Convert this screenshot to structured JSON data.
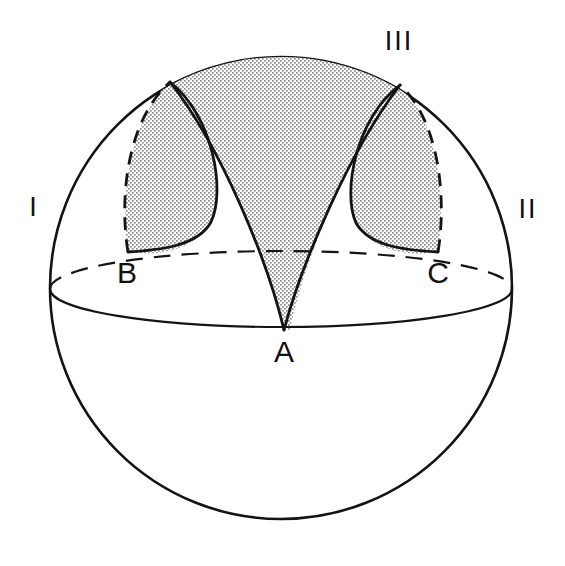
{
  "figure": {
    "background_color": "#ffffff",
    "line_color": "#141414",
    "shade_color": "#b4b4b4",
    "vertex_labels": [
      {
        "id": "A",
        "text": "A",
        "x": 284,
        "y": 354
      },
      {
        "id": "B",
        "text": "B",
        "x": 127,
        "y": 275
      },
      {
        "id": "C",
        "text": "C",
        "x": 438,
        "y": 275
      }
    ],
    "region_labels": [
      {
        "id": "I",
        "text": "I",
        "x": 34,
        "y": 209
      },
      {
        "id": "II",
        "text": "II",
        "x": 528,
        "y": 211
      },
      {
        "id": "III",
        "text": "III",
        "x": 399,
        "y": 43
      }
    ],
    "sphere": {
      "center_x": 281,
      "center_y": 288,
      "radius": 231
    },
    "equator": {
      "center_x": 281,
      "center_y": 289,
      "rx": 231,
      "ry": 38,
      "front_style": "solid",
      "back_style": "dashed"
    }
  }
}
